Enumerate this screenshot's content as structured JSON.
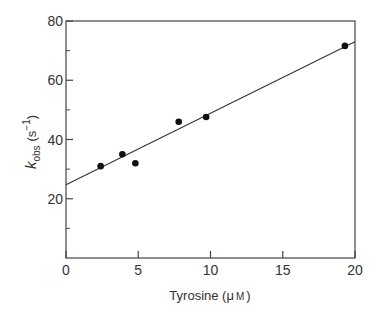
{
  "chart_data": {
    "type": "scatter",
    "title": "",
    "xlabel": "Tyrosine (μM)",
    "ylabel": "k_obs (s^-1)",
    "xlabel_parts": {
      "main": "Tyrosine (",
      "unit_mu": "μ",
      "unit_m": "M",
      "close": ")"
    },
    "ylabel_parts": {
      "k": "k",
      "sub": "obs",
      "open": "(s",
      "sup": "−1",
      "close": ")"
    },
    "xlim": [
      0,
      20
    ],
    "ylim": [
      0,
      80
    ],
    "x_ticks": [
      0,
      5,
      10,
      15,
      20
    ],
    "y_ticks": [
      20,
      40,
      60,
      80
    ],
    "y_minor_ticks": [
      10,
      30,
      50,
      70
    ],
    "grid": false,
    "legend": null,
    "series": [
      {
        "name": "data",
        "points": [
          {
            "x": 2.4,
            "y": 31
          },
          {
            "x": 3.9,
            "y": 35
          },
          {
            "x": 4.8,
            "y": 32
          },
          {
            "x": 7.8,
            "y": 46
          },
          {
            "x": 9.7,
            "y": 47.6
          },
          {
            "x": 19.3,
            "y": 71.6
          }
        ]
      }
    ],
    "fit_line": {
      "x0": 0,
      "y0": 24.7,
      "x1": 20,
      "y1": 73
    }
  }
}
